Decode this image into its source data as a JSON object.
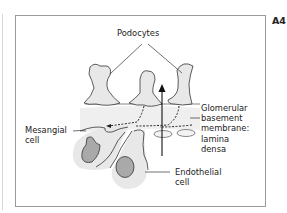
{
  "figure": {
    "panel_tag": "A4",
    "labels": {
      "podocytes": "Podocytes",
      "glomerular_bm": "Glomerular\nbasement\nmembrane:\nlamina\ndensa",
      "mesangial": "Mesangial\ncell",
      "endothelial": "Endothelial\ncell"
    },
    "colors": {
      "cell_fill": "#e8e8e8",
      "nucleus_fill": "#a9a9a9",
      "membrane_band": "#efefef",
      "stroke": "#333333",
      "frame": "#9a9a9a"
    }
  }
}
